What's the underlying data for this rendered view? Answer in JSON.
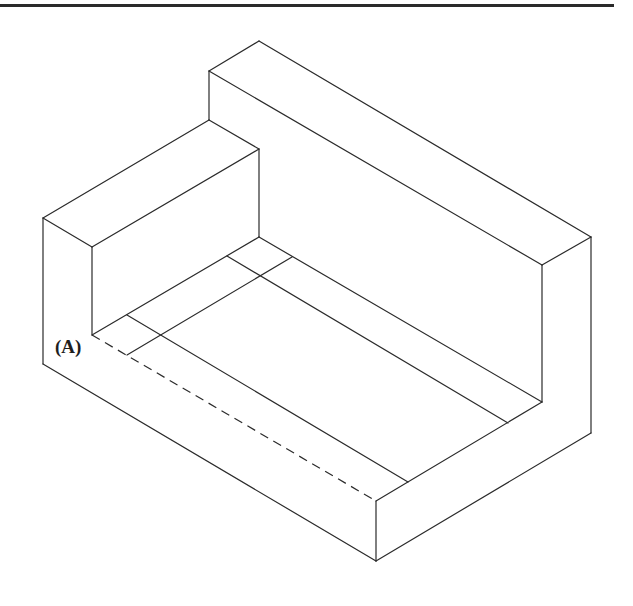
{
  "figure": {
    "type": "isometric-drawing",
    "line_color": "#2b2b2b",
    "background": "#ffffff",
    "rule_color": "#2a2a2a"
  },
  "labels": {
    "point_a": "(A)"
  }
}
